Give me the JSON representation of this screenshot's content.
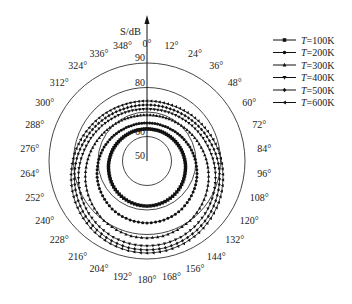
{
  "chart_data": {
    "type": "polar-line",
    "title": "",
    "radial_label": "S/dB",
    "radial_ticks": [
      50,
      60,
      80,
      90
    ],
    "radial_rings": [
      60,
      70,
      80,
      90
    ],
    "rlim": [
      50,
      90
    ],
    "angle_unit": "degree",
    "angle_ticks": [
      "0°",
      "12°",
      "24°",
      "36°",
      "48°",
      "60°",
      "72°",
      "84°",
      "96°",
      "108°",
      "120°",
      "132°",
      "144°",
      "156°",
      "168°",
      "180°",
      "192°",
      "204°",
      "216°",
      "228°",
      "240°",
      "252°",
      "264°",
      "276°",
      "288°",
      "300°",
      "312°",
      "324°",
      "336°",
      "348°"
    ],
    "angles": [
      0,
      12,
      24,
      36,
      48,
      60,
      72,
      84,
      96,
      108,
      120,
      132,
      144,
      156,
      168,
      180,
      192,
      204,
      216,
      228,
      240,
      252,
      264,
      276,
      288,
      300,
      312,
      324,
      336,
      348
    ],
    "legend_position": "upper right",
    "series": [
      {
        "name": "T=100K",
        "marker": "square",
        "values": [
          63.1,
          63.1,
          63.3,
          63.5,
          63.8,
          64.2,
          64.7,
          65.2,
          65.8,
          66.3,
          66.9,
          67.4,
          67.8,
          68.1,
          68.3,
          68.4,
          68.3,
          68.1,
          67.8,
          67.4,
          66.9,
          66.3,
          65.8,
          65.2,
          64.7,
          64.2,
          63.8,
          63.5,
          63.3,
          63.1
        ]
      },
      {
        "name": "T=200K",
        "marker": "circle",
        "values": [
          65.5,
          65.6,
          65.8,
          66.2,
          66.8,
          67.5,
          68.4,
          69.3,
          70.3,
          71.4,
          72.4,
          73.3,
          74.2,
          74.8,
          75.1,
          75.3,
          75.1,
          74.8,
          74.2,
          73.3,
          72.4,
          71.4,
          70.3,
          69.3,
          68.4,
          67.5,
          66.8,
          66.2,
          65.8,
          65.6
        ]
      },
      {
        "name": "T=300K",
        "marker": "triangle-up",
        "values": [
          68.8,
          68.9,
          69.2,
          69.7,
          70.4,
          71.3,
          72.4,
          73.7,
          75.0,
          76.4,
          77.7,
          78.9,
          80.0,
          80.7,
          81.3,
          81.4,
          81.3,
          80.7,
          80.0,
          78.9,
          77.7,
          76.4,
          75.0,
          73.7,
          72.4,
          71.3,
          70.4,
          69.7,
          69.2,
          68.9
        ]
      },
      {
        "name": "T=400K",
        "marker": "triangle-down",
        "values": [
          71.2,
          71.3,
          71.7,
          72.2,
          73.0,
          74.0,
          75.1,
          76.4,
          77.9,
          79.3,
          80.7,
          82.0,
          83.1,
          84.0,
          84.5,
          84.7,
          84.5,
          84.0,
          83.1,
          82.0,
          80.7,
          79.3,
          77.9,
          76.4,
          75.1,
          74.0,
          73.0,
          72.2,
          71.7,
          71.3
        ]
      },
      {
        "name": "T=500K",
        "marker": "diamond",
        "values": [
          72.9,
          73.0,
          73.3,
          73.9,
          74.7,
          75.7,
          76.8,
          78.2,
          79.6,
          81.0,
          82.4,
          83.7,
          84.8,
          85.6,
          86.2,
          86.3,
          86.2,
          85.6,
          84.8,
          83.7,
          82.4,
          81.0,
          79.6,
          78.2,
          76.8,
          75.7,
          74.7,
          73.9,
          73.3,
          73.0
        ]
      },
      {
        "name": "T=600K",
        "marker": "triangle-left",
        "values": [
          74.5,
          74.6,
          74.9,
          75.5,
          76.3,
          77.2,
          78.4,
          79.7,
          81.0,
          82.4,
          83.8,
          85.0,
          86.1,
          86.9,
          87.4,
          87.6,
          87.4,
          86.9,
          86.1,
          85.0,
          83.8,
          82.4,
          81.0,
          79.7,
          78.4,
          77.2,
          76.3,
          75.5,
          74.9,
          74.6
        ]
      }
    ]
  },
  "legend": {
    "items": [
      {
        "label": "T=100K",
        "marker": "square"
      },
      {
        "label": "T=200K",
        "marker": "circle"
      },
      {
        "label": "T=300K",
        "marker": "triangle-up"
      },
      {
        "label": "T=400K",
        "marker": "triangle-down"
      },
      {
        "label": "T=500K",
        "marker": "diamond"
      },
      {
        "label": "T=600K",
        "marker": "triangle-left"
      }
    ]
  },
  "colors": {
    "line": "#111111",
    "grid": "#333333",
    "text": "#222222"
  }
}
